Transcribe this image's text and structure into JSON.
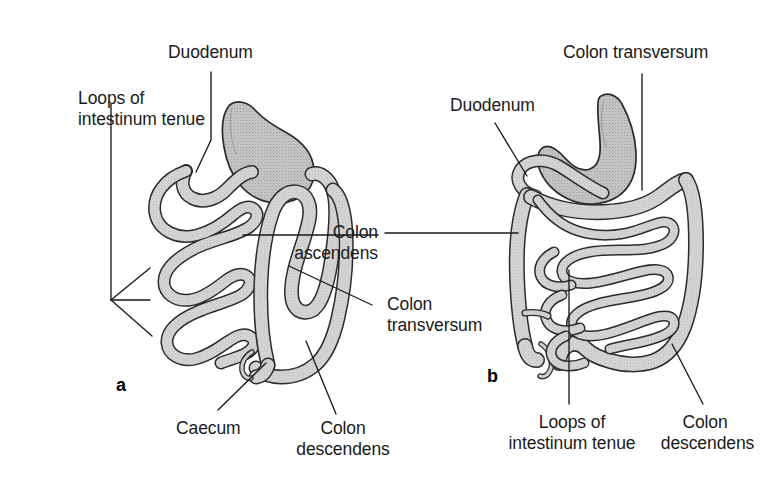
{
  "figure": {
    "background_color": "#ffffff",
    "line_color": "#1a1a1a",
    "organ_fill": "#c9c9c9",
    "organ_fill_light": "#dcdcdc",
    "stomach_fill": "#bfbfbf",
    "text_color": "#1a1a1a",
    "width": 781,
    "height": 495
  },
  "panels": [
    {
      "letter": "a",
      "name": "left-panel"
    },
    {
      "letter": "b",
      "name": "right-panel"
    }
  ],
  "labels": {
    "a_duodenum": "Duodenum",
    "a_loops_line1": "Loops of",
    "a_loops_line2": "intestinum tenue",
    "a_colon_ascendens_line1": "Colon",
    "a_colon_ascendens_line2": "ascendens",
    "a_colon_transversum_line1": "Colon",
    "a_colon_transversum_line2": "transversum",
    "a_caecum": "Caecum",
    "a_colon_descendens_line1": "Colon",
    "a_colon_descendens_line2": "descendens",
    "b_colon_transversum": "Colon transversum",
    "b_duodenum": "Duodenum",
    "b_loops_line1": "Loops of",
    "b_loops_line2": "intestinum tenue",
    "b_colon_descendens_line1": "Colon",
    "b_colon_descendens_line2": "descendens"
  }
}
